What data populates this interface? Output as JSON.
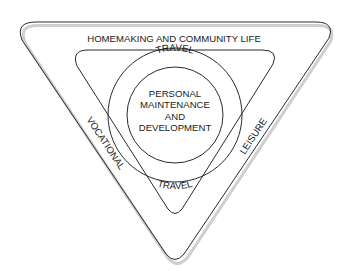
{
  "diagram": {
    "outer_triangle": {
      "label": "HOMEMAKING AND COMMUNITY LIFE"
    },
    "left_side": {
      "label": "VOCATIONAL"
    },
    "right_side": {
      "label": "LEISURE"
    },
    "ring": {
      "top_label": "TRAVEL",
      "bottom_label": "TRAVEL"
    },
    "core": {
      "lines": [
        "PERSONAL",
        "MAINTENANCE",
        "AND",
        "DEVELOPMENT"
      ]
    },
    "colors": {
      "stroke": "#2a2a2a",
      "shadow": "#c8c8c8",
      "text": "#1a1a1a",
      "background": "#ffffff"
    }
  }
}
